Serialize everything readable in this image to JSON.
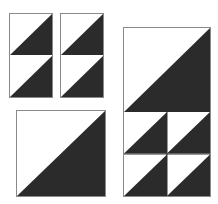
{
  "diagram": {
    "colors": {
      "dark": "#2b2b2b",
      "light": "#ffffff",
      "outline": "#8a8a8a"
    },
    "units": [
      {
        "id": "small-unit-1",
        "type": "two half-square triangles stacked",
        "cells": 2
      },
      {
        "id": "small-unit-2",
        "type": "two half-square triangles stacked",
        "cells": 2
      },
      {
        "id": "large-square",
        "type": "single half-square triangle",
        "cells": 1
      },
      {
        "id": "tall-unit",
        "type": "large half-square triangle above 2x2 half-square triangles",
        "cells": 5
      }
    ]
  }
}
